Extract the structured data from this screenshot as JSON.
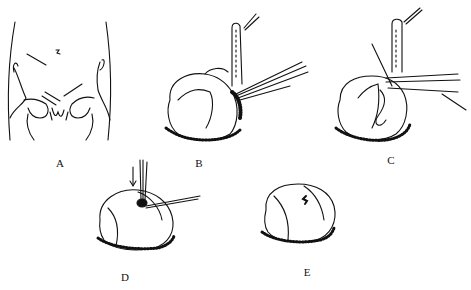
{
  "figure": {
    "panels": [
      {
        "id": "A",
        "label": "A",
        "subject": "abdomen-pelvis-outline"
      },
      {
        "id": "B",
        "label": "B",
        "subject": "organ-with-retracted-tube-and-instruments"
      },
      {
        "id": "C",
        "label": "C",
        "subject": "organ-suture-placement"
      },
      {
        "id": "D",
        "label": "D",
        "subject": "organ-with-needle-and-arrow"
      },
      {
        "id": "E",
        "label": "E",
        "subject": "organ-completed-repair"
      }
    ],
    "colors": {
      "ink": "#111111",
      "background": "#ffffff"
    }
  }
}
